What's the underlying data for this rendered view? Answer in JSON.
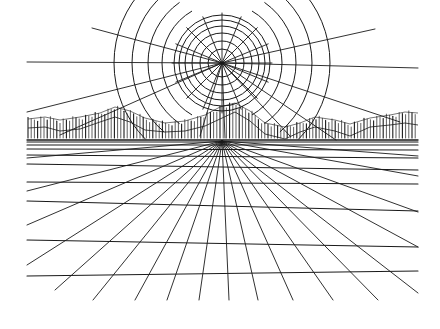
{
  "artwork": {
    "title": "Sun over mountains with perspective grid",
    "ink_color": "#1a1a1a",
    "paper_color": "#ffffff",
    "sun": {
      "cx": 222,
      "cy": 63,
      "inner_radii": [
        14,
        22,
        30,
        37,
        43,
        48
      ],
      "outer_arcs": [
        {
          "r": 60,
          "start_deg": 120,
          "end_deg": 240
        },
        {
          "r": 74,
          "start_deg": 125,
          "end_deg": 235
        },
        {
          "r": 90,
          "start_deg": 130,
          "end_deg": 230
        },
        {
          "r": 108,
          "start_deg": 135,
          "end_deg": 225
        },
        {
          "r": 60,
          "start_deg": -60,
          "end_deg": 60
        },
        {
          "r": 74,
          "start_deg": -55,
          "end_deg": 55
        },
        {
          "r": 90,
          "start_deg": -50,
          "end_deg": 50
        },
        {
          "r": 108,
          "start_deg": -45,
          "end_deg": 45
        }
      ],
      "inner_ray_count": 16,
      "long_rays": [
        {
          "x": 92,
          "y": 28
        },
        {
          "x": 27,
          "y": 62
        },
        {
          "x": 27,
          "y": 112
        },
        {
          "x": 375,
          "y": 29
        },
        {
          "x": 418,
          "y": 68
        },
        {
          "x": 400,
          "y": 122
        },
        {
          "x": 225,
          "y": 138
        },
        {
          "x": 60,
          "y": 135
        },
        {
          "x": 200,
          "y": 136
        },
        {
          "x": 336,
          "y": 140
        },
        {
          "x": 290,
          "y": 136
        }
      ]
    },
    "horizon": {
      "y": 140,
      "x_start": 27,
      "x_end": 418
    },
    "horizontal_lines": [
      {
        "y1": 142,
        "y2": 142
      },
      {
        "y1": 145,
        "y2": 145
      },
      {
        "y1": 149,
        "y2": 150
      },
      {
        "y1": 155,
        "y2": 158
      },
      {
        "y1": 164,
        "y2": 170
      },
      {
        "y1": 182,
        "y2": 184
      },
      {
        "y1": 201,
        "y2": 211
      },
      {
        "y1": 240,
        "y2": 247
      },
      {
        "y1": 276,
        "y2": 271
      }
    ],
    "vanishing_point": {
      "x": 222,
      "y": 141
    },
    "converging_endpoints": [
      {
        "x": 27,
        "y": 158
      },
      {
        "x": 27,
        "y": 191
      },
      {
        "x": 27,
        "y": 225
      },
      {
        "x": 27,
        "y": 265
      },
      {
        "x": 55,
        "y": 290
      },
      {
        "x": 93,
        "y": 300
      },
      {
        "x": 135,
        "y": 300
      },
      {
        "x": 167,
        "y": 300
      },
      {
        "x": 199,
        "y": 300
      },
      {
        "x": 229,
        "y": 300
      },
      {
        "x": 258,
        "y": 300
      },
      {
        "x": 293,
        "y": 300
      },
      {
        "x": 333,
        "y": 300
      },
      {
        "x": 378,
        "y": 300
      },
      {
        "x": 418,
        "y": 293
      },
      {
        "x": 418,
        "y": 247
      },
      {
        "x": 418,
        "y": 212
      },
      {
        "x": 418,
        "y": 176
      },
      {
        "x": 418,
        "y": 156
      }
    ],
    "mountains": {
      "base_y": 138,
      "x_start": 28,
      "x_end": 418,
      "spacing": 3.2,
      "profile": [
        [
          28,
          120
        ],
        [
          45,
          118
        ],
        [
          60,
          121
        ],
        [
          80,
          118
        ],
        [
          100,
          114
        ],
        [
          115,
          108
        ],
        [
          130,
          112
        ],
        [
          145,
          119
        ],
        [
          165,
          124
        ],
        [
          185,
          122
        ],
        [
          205,
          116
        ],
        [
          220,
          108
        ],
        [
          235,
          104
        ],
        [
          250,
          112
        ],
        [
          265,
          124
        ],
        [
          285,
          128
        ],
        [
          300,
          124
        ],
        [
          315,
          118
        ],
        [
          335,
          121
        ],
        [
          350,
          125
        ],
        [
          370,
          119
        ],
        [
          390,
          116
        ],
        [
          405,
          113
        ],
        [
          418,
          114
        ]
      ]
    }
  }
}
